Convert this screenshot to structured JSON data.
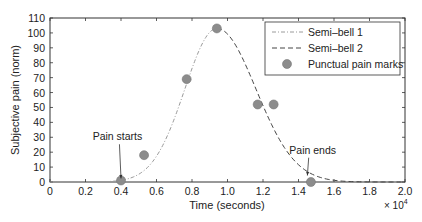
{
  "chart_data": {
    "type": "line",
    "title": "",
    "xlabel": "Time (seconds)",
    "ylabel": "Subjective pain (norm)",
    "x_multiplier_label": "× 10",
    "x_multiplier_exp": "4",
    "xlim": [
      0,
      2.0
    ],
    "ylim": [
      0,
      110
    ],
    "x_ticks": [
      0,
      0.2,
      0.4,
      0.6,
      0.8,
      1.0,
      1.2,
      1.4,
      1.6,
      1.8,
      2.0
    ],
    "x_tick_labels": [
      "0",
      "0.2",
      "0.4",
      "0.6",
      "0.8",
      "1.0",
      "1.2",
      "1.4",
      "1.6",
      "1.8",
      "2.0"
    ],
    "y_ticks": [
      0,
      10,
      20,
      30,
      40,
      50,
      60,
      70,
      80,
      90,
      100,
      110
    ],
    "grid": false,
    "legend_position": "upper right",
    "series": [
      {
        "name": "Semi–bell 1",
        "style": "dash-dot",
        "color": "#9a9a9a",
        "model": {
          "type": "gaussian",
          "peak_x": 0.94,
          "peak_y": 103,
          "sigma": 0.18,
          "x_from": 0.0,
          "x_to": 0.94
        }
      },
      {
        "name": "Semi–bell 2",
        "style": "dashed",
        "color": "#444444",
        "model": {
          "type": "gaussian",
          "peak_x": 0.94,
          "peak_y": 103,
          "sigma": 0.22,
          "x_from": 0.94,
          "x_to": 2.0
        }
      },
      {
        "name": "Punctual pain marks",
        "style": "markers",
        "color": "#8c8c8c",
        "x": [
          0.4,
          0.53,
          0.77,
          0.94,
          1.17,
          1.26,
          1.47
        ],
        "y": [
          1,
          18,
          69,
          103,
          52,
          52,
          0
        ]
      }
    ],
    "annotations": [
      {
        "text": "Pain starts",
        "x": 0.4,
        "y": 1,
        "text_x": 0.38,
        "text_y": 28
      },
      {
        "text": "Pain ends",
        "x": 1.45,
        "y": 3,
        "text_x": 1.48,
        "text_y": 19
      }
    ]
  }
}
